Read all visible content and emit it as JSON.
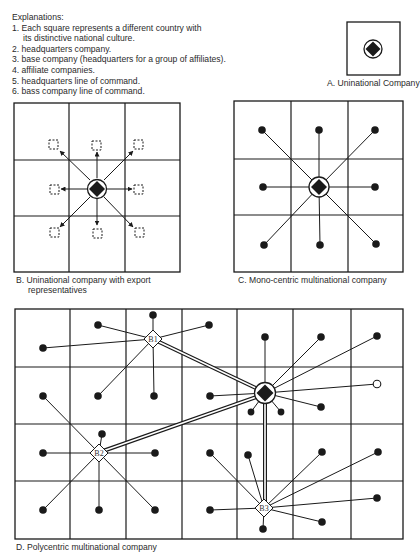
{
  "explanations": {
    "title": "Explanations:",
    "items": [
      {
        "line1": "1. Each square represents a different country with",
        "line2": "its distinctive national culture."
      },
      {
        "line1": "2. headquarters company."
      },
      {
        "line1": "3. base company (headquarters for a group of affiliates)."
      },
      {
        "line1": "4. affiliate companies."
      },
      {
        "line1": "5. headquarters line of command."
      },
      {
        "line1": "6. bass company line of command."
      }
    ]
  },
  "panels": {
    "A": {
      "caption": "A. Uninational Company"
    },
    "B": {
      "caption_line1": "B. Uninational company with export",
      "caption_line2": "representatives"
    },
    "C": {
      "caption": "C. Mono-centric multinational company"
    },
    "D": {
      "caption": "D. Polycentric multinational company",
      "base_labels": {
        "b1": "B1",
        "b2": "B2",
        "b3": "B3"
      }
    }
  },
  "colors": {
    "ink": "#1a1a1a",
    "background": "#ffffff"
  }
}
